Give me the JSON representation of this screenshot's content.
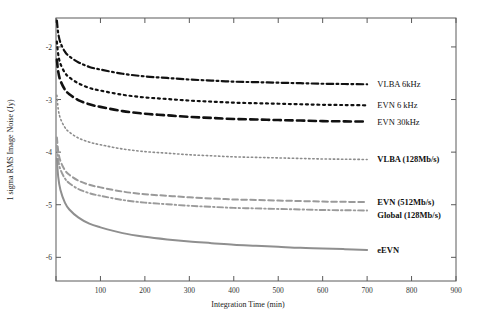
{
  "figure": {
    "title": "",
    "background": "#ffffff"
  },
  "chart_data": {
    "type": "line",
    "title": "",
    "subtitle": "",
    "xlabel": "Integration Time (min)",
    "ylabel": "1 sigma RMS Image Noise (Jy)",
    "xlim": [
      0,
      900
    ],
    "ylim": [
      -6.45,
      -1.45
    ],
    "xticks": [
      0,
      100,
      200,
      300,
      400,
      500,
      600,
      700,
      800,
      900
    ],
    "xtick_labels": [
      "",
      "100",
      "200",
      "300",
      "400",
      "500",
      "600",
      "700",
      "800",
      "900"
    ],
    "yticks": [
      -2,
      -3,
      -4,
      -5,
      -6
    ],
    "ytick_labels": [
      "-2",
      "-3",
      "-4",
      "-5",
      "-6"
    ],
    "grid": false,
    "legend_position": "right-inline",
    "note": "y values are log10 of 1-sigma RMS image noise in Jy; curves follow noise ~ 1/sqrt(t)",
    "x": [
      2,
      5,
      10,
      20,
      30,
      50,
      75,
      100,
      150,
      200,
      250,
      300,
      350,
      400,
      450,
      500,
      550,
      600,
      650,
      700
    ],
    "series": [
      {
        "name": "VLBA 6kHz",
        "color": "#111111",
        "linestyle": "dashdot",
        "linewidth": 2.2,
        "label_color": "#111111",
        "label_bold": false,
        "values": [
          -1.5,
          -1.74,
          -1.92,
          -2.09,
          -2.18,
          -2.29,
          -2.38,
          -2.43,
          -2.51,
          -2.56,
          -2.59,
          -2.62,
          -2.64,
          -2.66,
          -2.67,
          -2.68,
          -2.69,
          -2.7,
          -2.705,
          -2.71
        ]
      },
      {
        "name": "EVN 6 kHz",
        "color": "#111111",
        "linestyle": "dotted",
        "linewidth": 2.2,
        "label_color": "#111111",
        "label_bold": false,
        "values": [
          -1.9,
          -2.14,
          -2.32,
          -2.49,
          -2.58,
          -2.69,
          -2.78,
          -2.83,
          -2.91,
          -2.96,
          -2.99,
          -3.02,
          -3.04,
          -3.06,
          -3.07,
          -3.08,
          -3.09,
          -3.1,
          -3.105,
          -3.11
        ]
      },
      {
        "name": "EVN 30kHz",
        "color": "#111111",
        "linestyle": "dashed",
        "linewidth": 2.6,
        "label_color": "#111111",
        "label_bold": false,
        "values": [
          -2.24,
          -2.47,
          -2.64,
          -2.81,
          -2.9,
          -3.01,
          -3.09,
          -3.14,
          -3.22,
          -3.27,
          -3.3,
          -3.33,
          -3.35,
          -3.37,
          -3.38,
          -3.39,
          -3.4,
          -3.41,
          -3.415,
          -3.42
        ]
      },
      {
        "name": "VLBA (128Mb/s)",
        "color": "#8c8c8c",
        "linestyle": "dotted",
        "linewidth": 1.6,
        "label_color": "#111111",
        "label_bold": true,
        "values": [
          -2.92,
          -3.18,
          -3.36,
          -3.53,
          -3.62,
          -3.73,
          -3.81,
          -3.86,
          -3.94,
          -3.99,
          -4.02,
          -4.05,
          -4.07,
          -4.09,
          -4.1,
          -4.11,
          -4.12,
          -4.13,
          -4.135,
          -4.14
        ]
      },
      {
        "name": "EVN (512Mb/s)",
        "color": "#9a9a9a",
        "linestyle": "dashed",
        "linewidth": 2.0,
        "label_color": "#111111",
        "label_bold": true,
        "values": [
          -3.72,
          -3.98,
          -4.17,
          -4.34,
          -4.43,
          -4.54,
          -4.62,
          -4.67,
          -4.75,
          -4.8,
          -4.83,
          -4.86,
          -4.88,
          -4.9,
          -4.91,
          -4.92,
          -4.93,
          -4.94,
          -4.945,
          -4.95
        ]
      },
      {
        "name": "Global (128Mb/s)",
        "color": "#9a9a9a",
        "linestyle": "dashdot",
        "linewidth": 1.9,
        "label_color": "#111111",
        "label_bold": true,
        "values": [
          -3.88,
          -4.14,
          -4.33,
          -4.5,
          -4.59,
          -4.7,
          -4.78,
          -4.83,
          -4.91,
          -4.96,
          -4.99,
          -5.02,
          -5.04,
          -5.06,
          -5.07,
          -5.08,
          -5.09,
          -5.1,
          -5.105,
          -5.11
        ]
      },
      {
        "name": "eEVN",
        "color": "#8f8f8f",
        "linestyle": "solid",
        "linewidth": 2.0,
        "label_color": "#111111",
        "label_bold": true,
        "values": [
          -4.12,
          -4.47,
          -4.72,
          -4.96,
          -5.09,
          -5.24,
          -5.36,
          -5.43,
          -5.54,
          -5.61,
          -5.66,
          -5.7,
          -5.73,
          -5.76,
          -5.78,
          -5.8,
          -5.82,
          -5.83,
          -5.845,
          -5.86
        ]
      }
    ],
    "series_labels": [
      {
        "text": "VLBA 6kHz",
        "x": 723,
        "y": -2.705,
        "bold": false
      },
      {
        "text": "EVN 6 kHz",
        "x": 723,
        "y": -3.105,
        "bold": false
      },
      {
        "text": "EVN 30kHz",
        "x": 723,
        "y": -3.415,
        "bold": false
      },
      {
        "text": "VLBA (128Mb/s)",
        "x": 723,
        "y": -4.135,
        "bold": true
      },
      {
        "text": "EVN (512Mb/s)",
        "x": 723,
        "y": -4.945,
        "bold": true
      },
      {
        "text": "Global (128Mb/s)",
        "x": 723,
        "y": -5.195,
        "bold": true
      },
      {
        "text": "eEVN",
        "x": 723,
        "y": -5.855,
        "bold": true
      }
    ]
  }
}
